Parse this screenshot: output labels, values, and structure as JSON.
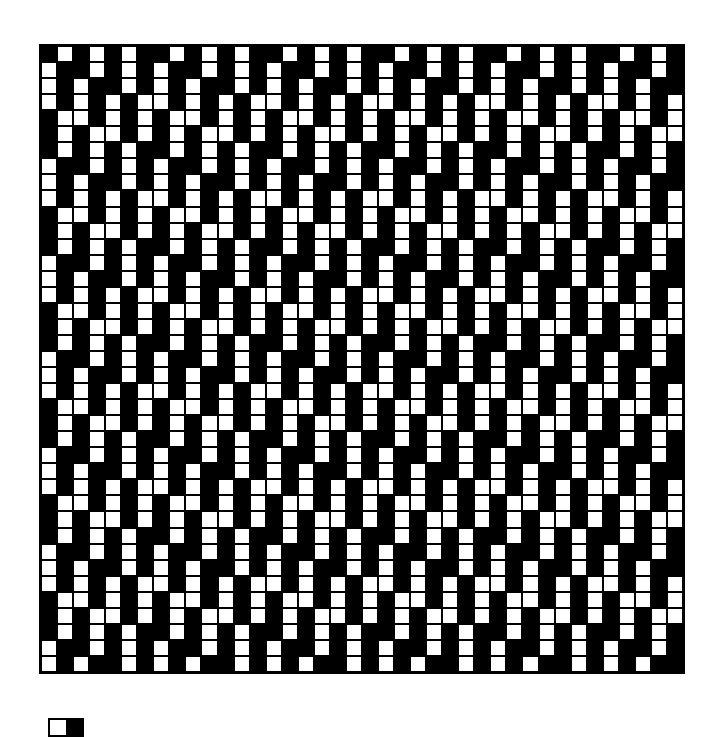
{
  "diagram": {
    "type": "weave-drawdown",
    "columns": 40,
    "rows": 39,
    "colors": {
      "warp_up": "#ffffff",
      "weft_up": "#000000"
    },
    "repeat": {
      "horizontal_period": 7,
      "vertical_period": 6,
      "motif_rows": [
        [
          0,
          1,
          0,
          1,
          0,
          1,
          0
        ],
        [
          1,
          0,
          0,
          1,
          0,
          1,
          0
        ],
        [
          1,
          0,
          1,
          0,
          0,
          1,
          0
        ],
        [
          1,
          0,
          1,
          0,
          1,
          0,
          1
        ],
        [
          0,
          1,
          1,
          0,
          1,
          0,
          1
        ],
        [
          0,
          1,
          0,
          1,
          1,
          0,
          1
        ]
      ]
    }
  },
  "legend": {
    "items": [
      {
        "name": "white-cell",
        "color": "#ffffff"
      },
      {
        "name": "black-cell",
        "color": "#000000"
      }
    ]
  }
}
